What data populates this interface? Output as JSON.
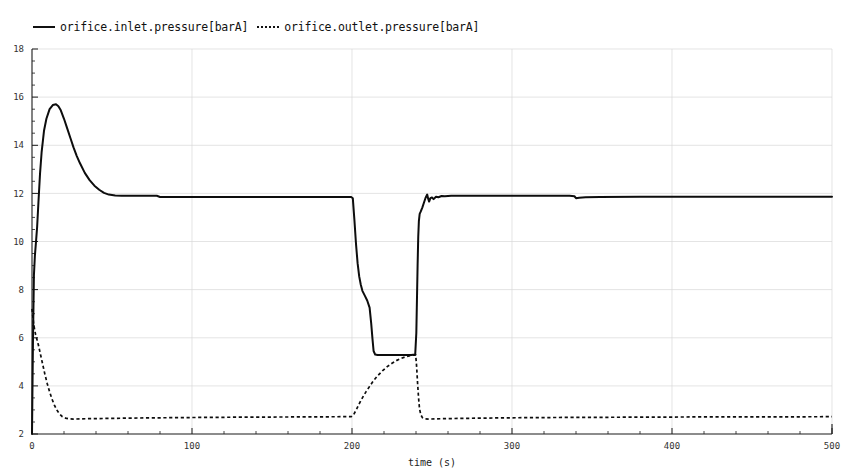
{
  "legend": {
    "position": "top-left",
    "entries": [
      {
        "label": "orifice.inlet.pressure[barA]",
        "style": "solid",
        "marker": "solid-line"
      },
      {
        "label": "orifice.outlet.pressure[barA]",
        "style": "dotted",
        "marker": "dotted-line"
      }
    ]
  },
  "chart_data": {
    "type": "line",
    "title": "",
    "subtitle": "",
    "xlabel": "time (s)",
    "ylabel": "",
    "xlim": [
      0,
      500
    ],
    "ylim": [
      2,
      18
    ],
    "xticks": [
      0,
      100,
      200,
      300,
      400,
      500
    ],
    "xtick_labels": [
      "0",
      "100",
      "200",
      "300",
      "400",
      "500"
    ],
    "yticks": [
      2,
      4,
      6,
      8,
      10,
      12,
      14,
      16,
      18
    ],
    "ytick_labels": [
      "2",
      "4",
      "6",
      "8",
      "10",
      "12",
      "14",
      "16",
      "18"
    ],
    "x_minor_interval": 20,
    "y_minor_interval": 0.5,
    "grid": true,
    "grid_color": "#d8d8d8",
    "line_color": "#0d0d0d",
    "background": "#ffffff",
    "series": [
      {
        "name": "orifice.inlet.pressure[barA]",
        "unit": "barA",
        "style": "solid",
        "points": [
          [
            0,
            2.0
          ],
          [
            0.6,
            5.8
          ],
          [
            1.2,
            8.6
          ],
          [
            1.8,
            9.4
          ],
          [
            2.4,
            9.9
          ],
          [
            3.2,
            10.6
          ],
          [
            4.0,
            11.6
          ],
          [
            5.0,
            12.8
          ],
          [
            6.0,
            13.7
          ],
          [
            7.5,
            14.6
          ],
          [
            9.0,
            15.1
          ],
          [
            11.0,
            15.5
          ],
          [
            13.0,
            15.67
          ],
          [
            15.0,
            15.7
          ],
          [
            16.5,
            15.62
          ],
          [
            18.0,
            15.45
          ],
          [
            20.0,
            15.1
          ],
          [
            22.0,
            14.7
          ],
          [
            24.0,
            14.3
          ],
          [
            26.0,
            13.9
          ],
          [
            28.0,
            13.55
          ],
          [
            30.0,
            13.25
          ],
          [
            33.0,
            12.85
          ],
          [
            36.0,
            12.55
          ],
          [
            39.0,
            12.32
          ],
          [
            42.0,
            12.15
          ],
          [
            45.0,
            12.02
          ],
          [
            48.0,
            11.95
          ],
          [
            52.0,
            11.91
          ],
          [
            56.0,
            11.9
          ],
          [
            60.0,
            11.9
          ],
          [
            70.0,
            11.9
          ],
          [
            78.0,
            11.9
          ],
          [
            80.0,
            11.85
          ],
          [
            90.0,
            11.85
          ],
          [
            110.0,
            11.85
          ],
          [
            140.0,
            11.85
          ],
          [
            170.0,
            11.85
          ],
          [
            195.0,
            11.85
          ],
          [
            199.5,
            11.85
          ],
          [
            200.5,
            11.8
          ],
          [
            201.5,
            10.9
          ],
          [
            202.5,
            9.9
          ],
          [
            203.5,
            9.1
          ],
          [
            204.5,
            8.55
          ],
          [
            205.5,
            8.2
          ],
          [
            206.5,
            7.95
          ],
          [
            208.0,
            7.75
          ],
          [
            209.5,
            7.55
          ],
          [
            211.0,
            7.25
          ],
          [
            212.0,
            6.6
          ],
          [
            212.8,
            5.95
          ],
          [
            213.5,
            5.45
          ],
          [
            214.5,
            5.3
          ],
          [
            216.0,
            5.28
          ],
          [
            220.0,
            5.28
          ],
          [
            226.0,
            5.28
          ],
          [
            232.0,
            5.28
          ],
          [
            237.0,
            5.28
          ],
          [
            239.5,
            5.3
          ],
          [
            240.2,
            6.2
          ],
          [
            240.6,
            7.6
          ],
          [
            241.0,
            9.0
          ],
          [
            241.4,
            10.2
          ],
          [
            241.8,
            10.85
          ],
          [
            242.3,
            11.15
          ],
          [
            243.0,
            11.25
          ],
          [
            244.0,
            11.42
          ],
          [
            245.0,
            11.62
          ],
          [
            246.0,
            11.82
          ],
          [
            247.0,
            11.95
          ],
          [
            247.6,
            11.78
          ],
          [
            248.2,
            11.66
          ],
          [
            249.0,
            11.8
          ],
          [
            250.0,
            11.83
          ],
          [
            251.0,
            11.76
          ],
          [
            252.5,
            11.86
          ],
          [
            254.0,
            11.84
          ],
          [
            256.0,
            11.89
          ],
          [
            258.0,
            11.88
          ],
          [
            262.0,
            11.9
          ],
          [
            268.0,
            11.9
          ],
          [
            280.0,
            11.9
          ],
          [
            300.0,
            11.9
          ],
          [
            320.0,
            11.9
          ],
          [
            336.0,
            11.9
          ],
          [
            339.0,
            11.88
          ],
          [
            340.0,
            11.8
          ],
          [
            342.0,
            11.82
          ],
          [
            346.0,
            11.84
          ],
          [
            355.0,
            11.85
          ],
          [
            380.0,
            11.86
          ],
          [
            410.0,
            11.86
          ],
          [
            440.0,
            11.86
          ],
          [
            470.0,
            11.86
          ],
          [
            500.0,
            11.86
          ]
        ]
      },
      {
        "name": "orifice.outlet.pressure[barA]",
        "unit": "barA",
        "style": "dotted",
        "points": [
          [
            0,
            7.2
          ],
          [
            0.5,
            6.9
          ],
          [
            1.0,
            6.6
          ],
          [
            1.6,
            6.35
          ],
          [
            2.2,
            6.15
          ],
          [
            3.0,
            5.95
          ],
          [
            4.0,
            5.7
          ],
          [
            5.0,
            5.4
          ],
          [
            6.5,
            4.95
          ],
          [
            8.0,
            4.5
          ],
          [
            9.5,
            4.1
          ],
          [
            11.0,
            3.75
          ],
          [
            12.5,
            3.45
          ],
          [
            14.0,
            3.2
          ],
          [
            15.5,
            3.0
          ],
          [
            17.0,
            2.85
          ],
          [
            19.0,
            2.72
          ],
          [
            21.0,
            2.66
          ],
          [
            23.0,
            2.63
          ],
          [
            26.0,
            2.62
          ],
          [
            30.0,
            2.63
          ],
          [
            40.0,
            2.64
          ],
          [
            60.0,
            2.66
          ],
          [
            90.0,
            2.68
          ],
          [
            130.0,
            2.7
          ],
          [
            170.0,
            2.71
          ],
          [
            196.0,
            2.72
          ],
          [
            199.5,
            2.72
          ],
          [
            201.0,
            2.8
          ],
          [
            203.0,
            3.05
          ],
          [
            205.0,
            3.32
          ],
          [
            207.0,
            3.56
          ],
          [
            209.0,
            3.78
          ],
          [
            211.0,
            3.98
          ],
          [
            213.5,
            4.22
          ],
          [
            216.0,
            4.42
          ],
          [
            219.0,
            4.62
          ],
          [
            222.0,
            4.8
          ],
          [
            225.0,
            4.94
          ],
          [
            228.0,
            5.06
          ],
          [
            231.0,
            5.15
          ],
          [
            234.0,
            5.22
          ],
          [
            236.5,
            5.26
          ],
          [
            238.5,
            5.28
          ],
          [
            239.8,
            5.28
          ],
          [
            240.4,
            4.8
          ],
          [
            241.0,
            4.1
          ],
          [
            241.6,
            3.5
          ],
          [
            242.2,
            3.05
          ],
          [
            243.0,
            2.8
          ],
          [
            244.0,
            2.68
          ],
          [
            245.5,
            2.63
          ],
          [
            248.0,
            2.62
          ],
          [
            252.0,
            2.63
          ],
          [
            260.0,
            2.64
          ],
          [
            280.0,
            2.66
          ],
          [
            310.0,
            2.68
          ],
          [
            340.0,
            2.69
          ],
          [
            380.0,
            2.7
          ],
          [
            420.0,
            2.71
          ],
          [
            460.0,
            2.71
          ],
          [
            500.0,
            2.72
          ]
        ]
      }
    ]
  }
}
